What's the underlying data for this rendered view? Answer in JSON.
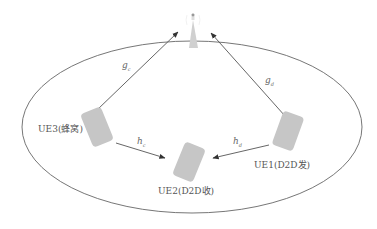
{
  "diagram": {
    "title": "",
    "base_station": {
      "label": ""
    },
    "nodes": {
      "ue3": {
        "label": "UE3(蜂窝)"
      },
      "ue1": {
        "label": "UE1(D2D发)"
      },
      "ue2": {
        "label": "UE2(D2D收)"
      }
    },
    "links": {
      "gc": {
        "symbol": "g",
        "sub": "c"
      },
      "gd": {
        "symbol": "g",
        "sub": "d"
      },
      "hc": {
        "symbol": "h",
        "sub": "c"
      },
      "hd": {
        "symbol": "h",
        "sub": "d"
      }
    },
    "colors": {
      "line": "#555555",
      "device": "#c8c8c8",
      "tower": "#cfcfcf"
    }
  }
}
